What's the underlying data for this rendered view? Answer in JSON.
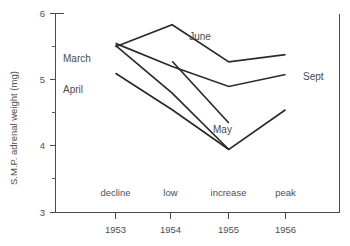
{
  "chart_data": {
    "type": "line",
    "title": "",
    "xlabel": "",
    "ylabel": "S.M.P. adrenal weight (mg)",
    "x": [
      1953,
      1954,
      1955,
      1956
    ],
    "x_tick_labels": [
      "1953",
      "1954",
      "1955",
      "1956"
    ],
    "phase_labels": [
      "decline",
      "low",
      "increase",
      "peak"
    ],
    "ylim": [
      3,
      6
    ],
    "y_ticks_major": [
      3,
      4,
      5,
      6
    ],
    "y_tick_labels": [
      "3",
      "4",
      "5",
      "6"
    ],
    "y_ticks_minor": [
      3.5,
      4.5,
      5.5
    ],
    "grid": false,
    "legend": "inline-annotations",
    "line_color": "#2b2b2b",
    "axis_color": "#4a4a4a",
    "series": [
      {
        "name": "June",
        "label": "June",
        "x": [
          1953,
          1954,
          1955,
          1956
        ],
        "values": [
          5.5,
          5.83,
          5.27,
          5.38
        ]
      },
      {
        "name": "Sept",
        "label": "Sept",
        "x": [
          1953,
          1954,
          1955,
          1956
        ],
        "values": [
          5.55,
          5.2,
          4.9,
          5.08
        ]
      },
      {
        "name": "March",
        "label": "March",
        "x": [
          1953,
          1954,
          1955,
          1956
        ],
        "values": [
          5.52,
          4.8,
          3.95,
          4.55
        ]
      },
      {
        "name": "April",
        "label": "April",
        "x": [
          1953,
          1954,
          1955
        ],
        "values": [
          5.1,
          4.55,
          3.95
        ]
      },
      {
        "name": "May",
        "label": "May",
        "x": [
          1954,
          1955
        ],
        "values": [
          5.28,
          4.35
        ]
      }
    ],
    "annotations": [
      {
        "text": "June",
        "x": 1954.3,
        "y": 5.72
      },
      {
        "text": "Sept",
        "x": 1956.1,
        "y": 5.18
      },
      {
        "text": "March",
        "x": 1952.75,
        "y": 5.17
      },
      {
        "text": "April",
        "x": 1952.75,
        "y": 4.72
      },
      {
        "text": "May",
        "x": 1955.0,
        "y": 4.22
      }
    ]
  },
  "axis": {
    "y_label": "S.M.P. adrenal weight (mg)",
    "y_ticks": [
      {
        "label": "6",
        "value": 6
      },
      {
        "label": "5",
        "value": 5
      },
      {
        "label": "4",
        "value": 4
      },
      {
        "label": "3",
        "value": 3
      }
    ],
    "x_ticks": [
      {
        "label": "1953",
        "value": 1953
      },
      {
        "label": "1954",
        "value": 1954
      },
      {
        "label": "1955",
        "value": 1955
      },
      {
        "label": "1956",
        "value": 1956
      }
    ],
    "phases": [
      {
        "label": "decline"
      },
      {
        "label": "low"
      },
      {
        "label": "increase"
      },
      {
        "label": "peak"
      }
    ]
  },
  "series_labels": {
    "june": "June",
    "sept": "Sept",
    "march": "March",
    "april": "April",
    "may": "May"
  }
}
